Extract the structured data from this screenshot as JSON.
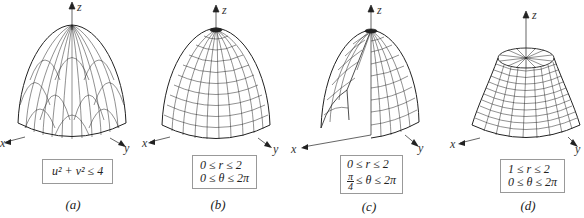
{
  "figure": {
    "panels": [
      {
        "id": "a",
        "caption": "(a)",
        "axes": {
          "x": "x",
          "y": "y",
          "z": "z"
        },
        "domain_lines": [
          "u² + v² ≤ 4"
        ],
        "description": "paraboloid parametrized over a disk in uv-plane (rectangular mesh)"
      },
      {
        "id": "b",
        "caption": "(b)",
        "axes": {
          "x": "x",
          "y": "y",
          "z": "z"
        },
        "domain_lines": [
          "0 ≤ r ≤ 2",
          "0 ≤ θ ≤ 2π"
        ],
        "description": "full paraboloid, polar mesh"
      },
      {
        "id": "c",
        "caption": "(c)",
        "axes": {
          "x": "x",
          "y": "y",
          "z": "z"
        },
        "domain_lines": [
          "0 ≤ r ≤ 2",
          "≤ θ ≤ 2π"
        ],
        "fraction": {
          "num": "π",
          "den": "4"
        },
        "description": "paraboloid with wedge removed"
      },
      {
        "id": "d",
        "caption": "(d)",
        "axes": {
          "x": "x",
          "y": "y",
          "z": "z"
        },
        "domain_lines": [
          "1 ≤ r ≤ 2",
          "0 ≤ θ ≤ 2π"
        ],
        "description": "truncated paraboloid (top removed)"
      }
    ]
  }
}
